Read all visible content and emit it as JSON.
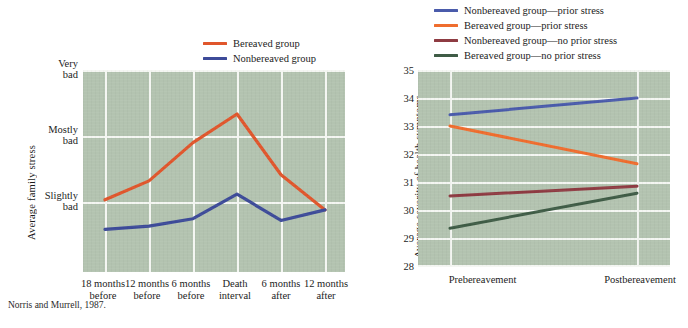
{
  "caption": "Norris and Murrell, 1987.",
  "colors": {
    "plot_background": "#b3c3b0",
    "gridline": "#f4f6f2",
    "page_background": "#ffffff",
    "bereaved_red": "#e0562c",
    "nonbereaved_blue": "#3d4b99",
    "nonbereaved_prior_blue": "#4a5bab",
    "bereaved_prior_orange": "#ef6d2e",
    "nonbereaved_noprior_maroon": "#8e3b42",
    "bereaved_noprior_green": "#3f5c46"
  },
  "left_chart": {
    "ylabel": "Average family stress",
    "ytick_labels": [
      "Very\nbad",
      "Mostly\nbad",
      "Slightly\nbad"
    ],
    "ytick_lines": [
      "Very bad",
      "Mostly bad",
      "Slightly bad"
    ],
    "categories": [
      "18 months\nbefore",
      "12 months\nbefore",
      "6 months\nbefore",
      "Death\ninterval",
      "6 months\nafter",
      "12 months\nafter"
    ],
    "legend": [
      {
        "label": "Bereaved group",
        "color": "#e0562c"
      },
      {
        "label": "Nonbereaved group",
        "color": "#3d4b99"
      }
    ]
  },
  "right_chart": {
    "ylabel": "Average severity of health symptoms",
    "ytick_labels": [
      "35",
      "34",
      "33",
      "32",
      "31",
      "30",
      "29",
      "28"
    ],
    "categories": [
      "Prebereavement",
      "Postbereavement"
    ],
    "legend": [
      {
        "label": "Nonbereaved group—prior stress",
        "color": "#4a5bab"
      },
      {
        "label": "Bereaved group—prior stress",
        "color": "#ef6d2e"
      },
      {
        "label": "Nonbereaved group—no prior stress",
        "color": "#8e3b42"
      },
      {
        "label": "Bereaved group—no prior stress",
        "color": "#3f5c46"
      }
    ]
  },
  "chart_data": [
    {
      "type": "line",
      "title": "",
      "xlabel": "",
      "ylabel": "Average family stress",
      "categories": [
        "18 months before",
        "12 months before",
        "6 months before",
        "Death interval",
        "6 months after",
        "12 months after"
      ],
      "ytick_labels": [
        "Very bad",
        "Mostly bad",
        "Slightly bad"
      ],
      "ytick_values": [
        5,
        3.5,
        2
      ],
      "ylim": [
        0.6,
        5.4
      ],
      "grid": true,
      "legend_position": "top-right",
      "series": [
        {
          "name": "Bereaved group",
          "color": "#e0562c",
          "values": [
            2.05,
            2.48,
            3.35,
            4.0,
            2.62,
            1.82
          ]
        },
        {
          "name": "Nonbereaved group",
          "color": "#3d4b99",
          "values": [
            1.38,
            1.45,
            1.62,
            2.18,
            1.58,
            1.82
          ]
        }
      ]
    },
    {
      "type": "line",
      "title": "",
      "xlabel": "",
      "ylabel": "Average severity of health symptoms",
      "categories": [
        "Prebereavement",
        "Postbereavement"
      ],
      "ylim": [
        28,
        35
      ],
      "yticks": [
        28,
        29,
        30,
        31,
        32,
        33,
        34,
        35
      ],
      "grid": true,
      "legend_position": "top",
      "series": [
        {
          "name": "Nonbereaved group—prior stress",
          "color": "#4a5bab",
          "values": [
            33.4,
            34.0
          ]
        },
        {
          "name": "Bereaved group—prior stress",
          "color": "#ef6d2e",
          "values": [
            33.0,
            31.65
          ]
        },
        {
          "name": "Nonbereaved group—no prior stress",
          "color": "#8e3b42",
          "values": [
            30.5,
            30.85
          ]
        },
        {
          "name": "Bereaved group—no prior stress",
          "color": "#3f5c46",
          "values": [
            29.35,
            30.6
          ]
        }
      ]
    }
  ]
}
